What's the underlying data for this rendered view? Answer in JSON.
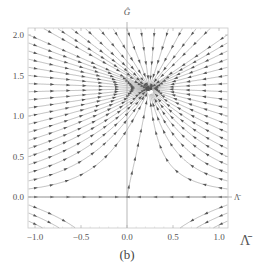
{
  "chart_data": {
    "type": "streamplot",
    "title": "",
    "caption": "(b)",
    "xlabel": "Λ̄",
    "xlabel_inline": "Λ̄",
    "ylabel": "Ĝ",
    "xlim": [
      -1.05,
      1.1
    ],
    "ylim": [
      -0.38,
      2.08
    ],
    "x_ticks": [
      -1.0,
      -0.5,
      0.0,
      0.5,
      1.0
    ],
    "x_tick_labels": [
      "−1.0",
      "−0.5",
      "0.0",
      "0.5",
      "1.0"
    ],
    "y_ticks": [
      0.0,
      0.5,
      1.0,
      1.5,
      2.0
    ],
    "y_tick_labels": [
      "0.0",
      "0.5",
      "1.0",
      "1.5",
      "2.0"
    ],
    "grid": false,
    "axes_through_origin": true,
    "fixed_points": [
      {
        "x": 0.25,
        "y": 1.3,
        "type": "stable node"
      },
      {
        "x": 0.0,
        "y": 0.0,
        "type": "saddle"
      }
    ],
    "colors": {
      "stream": "#8a8a8a",
      "arrow": "#555555",
      "frame": "#bbbbbb",
      "axis": "#999999"
    }
  }
}
